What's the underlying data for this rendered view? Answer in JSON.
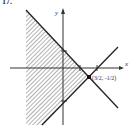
{
  "problem_number": "17.",
  "axes": {
    "x_label": "x",
    "y_label": "y"
  },
  "lines": [
    {
      "equation": "y = -x + 1",
      "x_intercept": 1,
      "y_intercept": 1
    },
    {
      "equation": "y = x - 2",
      "x_intercept": 2,
      "y_intercept": -2
    }
  ],
  "vertex": {
    "label": "(3/2, -1/2)",
    "x": 1.5,
    "y": -0.5
  },
  "shaded_region": "left of both lines",
  "colors": {
    "line": "#222222",
    "hatch": "#555555"
  }
}
